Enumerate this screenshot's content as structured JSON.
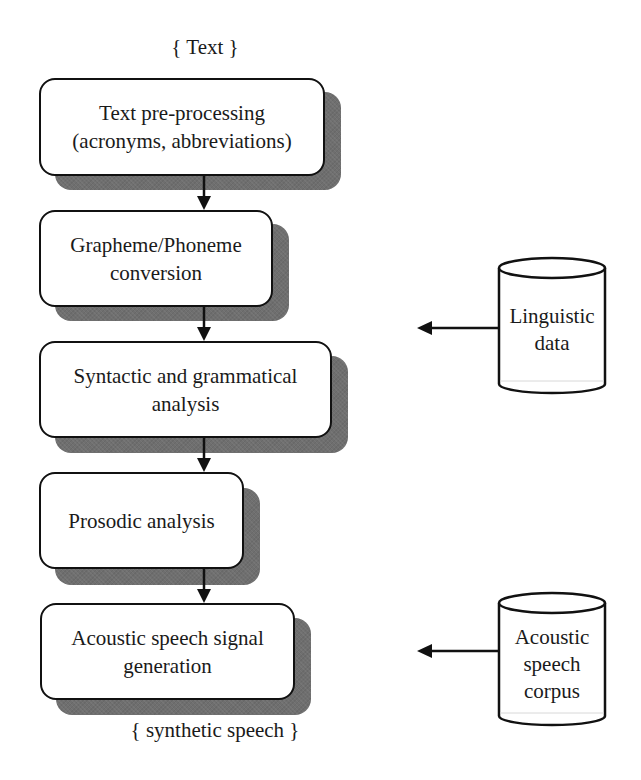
{
  "diagram": {
    "type": "flowchart",
    "input_label": "{ Text }",
    "output_label": "{ synthetic speech }",
    "colors": {
      "stroke": "#111111",
      "box_fill": "#ffffff",
      "shadow": "#6f6f6f",
      "text": "#1a1a1a",
      "background": "#ffffff"
    },
    "steps": [
      {
        "id": "step1",
        "lines": [
          "Text pre-processing",
          "(acronyms, abbreviations)"
        ]
      },
      {
        "id": "step2",
        "lines": [
          "Grapheme/Phoneme",
          "conversion"
        ]
      },
      {
        "id": "step3",
        "lines": [
          "Syntactic and grammatical",
          "analysis"
        ]
      },
      {
        "id": "step4",
        "lines": [
          "Prosodic analysis"
        ]
      },
      {
        "id": "step5",
        "lines": [
          "Acoustic speech signal",
          "generation"
        ]
      }
    ],
    "data_stores": [
      {
        "id": "store1",
        "lines": [
          "Linguistic",
          "data"
        ],
        "feeds_into": "between step2 and step3"
      },
      {
        "id": "store2",
        "lines": [
          "Acoustic",
          "speech",
          "corpus"
        ],
        "feeds_into": "step5"
      }
    ],
    "edges": [
      {
        "from": "step1",
        "to": "step2"
      },
      {
        "from": "step2",
        "to": "step3"
      },
      {
        "from": "step3",
        "to": "step4"
      },
      {
        "from": "step4",
        "to": "step5"
      },
      {
        "from": "store1",
        "to": "pipeline"
      },
      {
        "from": "store2",
        "to": "pipeline"
      }
    ]
  }
}
